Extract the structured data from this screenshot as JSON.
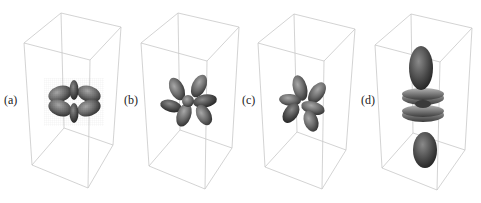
{
  "figure": {
    "panels": [
      {
        "id": "a",
        "label": "(a)",
        "shape": "four-lobe rosette with small vertical lobes"
      },
      {
        "id": "b",
        "label": "(b)",
        "shape": "six-lobe rosette, tilted"
      },
      {
        "id": "c",
        "label": "(c)",
        "shape": "six-lobe rosette, tilted"
      },
      {
        "id": "d",
        "label": "(d)",
        "shape": "vertical dumbbell lobes with two toroidal rings"
      }
    ],
    "colors": {
      "box_edge": "#c8c8c8",
      "surface_dark": "#3a3a3a",
      "surface_mid": "#6e6e6e",
      "surface_light": "#9a9a9a",
      "background": "#ffffff"
    }
  }
}
